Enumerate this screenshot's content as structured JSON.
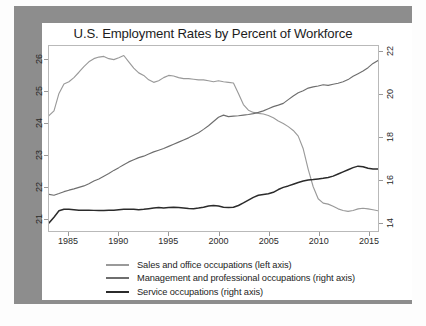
{
  "page": {
    "border_color": "#8d8d8d",
    "background": "#ffffff"
  },
  "chart": {
    "title": "U.S. Employment Rates by Percent of Workforce"
  },
  "legend": {
    "items": [
      {
        "label": "Sales and office occupations (left axis)",
        "color": "#9a9a9a",
        "key": "sales"
      },
      {
        "label": "Management and professional occupations (right axis)",
        "color": "#6e6e6e",
        "key": "management"
      },
      {
        "label": "Service occupations (right axis)",
        "color": "#2b2b2b",
        "key": "service"
      }
    ]
  },
  "axes": {
    "left_ticks": [
      "21",
      "22",
      "23",
      "24",
      "25",
      "26"
    ],
    "right_ticks": [
      "14",
      "16",
      "18",
      "20",
      "22"
    ],
    "x_ticks": [
      "1985",
      "1990",
      "1995",
      "2000",
      "2005",
      "2010",
      "2015"
    ]
  },
  "chart_data": {
    "type": "line",
    "title": "U.S. Employment Rates by Percent of Workforce",
    "xlabel": "",
    "ylabel": "",
    "grid": false,
    "legend_position": "bottom",
    "xlim": [
      1983,
      2016
    ],
    "x_ticks": [
      1985,
      1990,
      1995,
      2000,
      2005,
      2010,
      2015
    ],
    "left_axis": {
      "ylim": [
        20.6,
        26.45
      ],
      "ticks": [
        21,
        22,
        23,
        24,
        25,
        26
      ],
      "series_keys": [
        "sales"
      ]
    },
    "right_axis": {
      "ylim": [
        13.6,
        22.3
      ],
      "ticks": [
        14,
        16,
        18,
        20,
        22
      ],
      "series_keys": [
        "management",
        "service"
      ]
    },
    "x": [
      1983,
      1983.5,
      1984,
      1984.5,
      1985,
      1985.5,
      1986,
      1986.5,
      1987,
      1987.5,
      1988,
      1988.5,
      1989,
      1989.5,
      1990,
      1990.5,
      1991,
      1991.5,
      1992,
      1992.5,
      1993,
      1993.5,
      1994,
      1994.5,
      1995,
      1995.5,
      1996,
      1996.5,
      1997,
      1997.5,
      1998,
      1998.5,
      1999,
      1999.5,
      2000,
      2000.5,
      2001,
      2001.5,
      2002,
      2002.5,
      2003,
      2003.5,
      2004,
      2004.5,
      2005,
      2005.5,
      2006,
      2006.5,
      2007,
      2007.5,
      2008,
      2008.5,
      2009,
      2009.5,
      2010,
      2010.5,
      2011,
      2011.5,
      2012,
      2012.5,
      2013,
      2013.5,
      2014,
      2014.5,
      2015,
      2015.5,
      2016
    ],
    "series": [
      {
        "name": "Sales and office occupations (left axis)",
        "key": "sales",
        "axis": "left",
        "color": "#9a9a9a",
        "values": [
          24.25,
          24.4,
          24.95,
          25.25,
          25.32,
          25.45,
          25.62,
          25.8,
          25.95,
          26.05,
          26.1,
          26.12,
          26.05,
          26.02,
          26.08,
          26.15,
          25.95,
          25.75,
          25.6,
          25.52,
          25.38,
          25.3,
          25.35,
          25.45,
          25.52,
          25.5,
          25.45,
          25.42,
          25.42,
          25.4,
          25.38,
          25.38,
          25.35,
          25.32,
          25.35,
          25.32,
          25.3,
          25.28,
          24.95,
          24.6,
          24.42,
          24.35,
          24.32,
          24.3,
          24.25,
          24.18,
          24.08,
          24.0,
          23.9,
          23.78,
          23.6,
          23.2,
          22.55,
          22.0,
          21.62,
          21.48,
          21.45,
          21.38,
          21.3,
          21.25,
          21.22,
          21.25,
          21.3,
          21.32,
          21.3,
          21.27,
          21.24
        ]
      },
      {
        "name": "Management and professional occupations (right axis)",
        "key": "management",
        "axis": "right",
        "color": "#6e6e6e",
        "values": [
          15.32,
          15.28,
          15.36,
          15.45,
          15.52,
          15.58,
          15.65,
          15.72,
          15.82,
          15.95,
          16.05,
          16.18,
          16.3,
          16.45,
          16.58,
          16.72,
          16.85,
          16.95,
          17.05,
          17.12,
          17.22,
          17.32,
          17.4,
          17.48,
          17.58,
          17.68,
          17.78,
          17.88,
          17.98,
          18.1,
          18.22,
          18.38,
          18.55,
          18.75,
          18.95,
          19.05,
          18.98,
          19.0,
          19.02,
          19.05,
          19.08,
          19.12,
          19.18,
          19.25,
          19.35,
          19.45,
          19.52,
          19.6,
          19.78,
          19.95,
          20.1,
          20.2,
          20.32,
          20.38,
          20.42,
          20.48,
          20.45,
          20.5,
          20.55,
          20.62,
          20.72,
          20.88,
          21.0,
          21.12,
          21.28,
          21.48,
          21.62
        ]
      },
      {
        "name": "Service occupations (right axis)",
        "key": "service",
        "axis": "right",
        "color": "#2b2b2b",
        "values": [
          13.98,
          14.25,
          14.55,
          14.62,
          14.62,
          14.6,
          14.58,
          14.58,
          14.58,
          14.57,
          14.56,
          14.56,
          14.58,
          14.58,
          14.6,
          14.62,
          14.62,
          14.62,
          14.6,
          14.62,
          14.65,
          14.68,
          14.7,
          14.68,
          14.7,
          14.72,
          14.7,
          14.68,
          14.66,
          14.65,
          14.68,
          14.72,
          14.78,
          14.8,
          14.78,
          14.72,
          14.7,
          14.72,
          14.8,
          14.92,
          15.05,
          15.18,
          15.28,
          15.32,
          15.35,
          15.42,
          15.55,
          15.65,
          15.72,
          15.8,
          15.88,
          15.95,
          16.0,
          16.02,
          16.05,
          16.08,
          16.12,
          16.18,
          16.28,
          16.38,
          16.48,
          16.58,
          16.65,
          16.62,
          16.55,
          16.52,
          16.52
        ]
      }
    ]
  }
}
